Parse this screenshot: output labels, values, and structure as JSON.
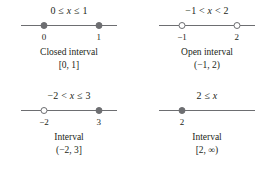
{
  "figure": {
    "kind": "number-line-interval-diagram",
    "line_color": "#6d6e71",
    "text_color": "#231f20",
    "background": "#ffffff"
  },
  "panels": [
    {
      "id": "closed-interval",
      "inequality": "0 ≤ x ≤ 1",
      "inequality_parts": {
        "left": "0 ≤ ",
        "variable": "x",
        "right": " ≤ 1"
      },
      "caption": "Closed interval",
      "notation": "[0, 1]",
      "endpoints": [
        {
          "label": "0",
          "type": "filled",
          "pos_pct": 24
        },
        {
          "label": "1",
          "type": "filled",
          "pos_pct": 81
        }
      ]
    },
    {
      "id": "open-interval",
      "inequality": "−1 < x < 2",
      "inequality_parts": {
        "left": "−1 < ",
        "variable": "x",
        "right": " < 2"
      },
      "caption": "Open interval",
      "notation": "(−1, 2)",
      "endpoints": [
        {
          "label": "−1",
          "type": "open",
          "pos_pct": 24
        },
        {
          "label": "2",
          "type": "open",
          "pos_pct": 81
        }
      ]
    },
    {
      "id": "half-open-interval",
      "inequality": "−2 < x ≤ 3",
      "inequality_parts": {
        "left": "−2 < ",
        "variable": "x",
        "right": " ≤ 3"
      },
      "caption": "Interval",
      "notation": "(−2, 3]",
      "endpoints": [
        {
          "label": "−2",
          "type": "open",
          "pos_pct": 24
        },
        {
          "label": "3",
          "type": "filled",
          "pos_pct": 81
        }
      ]
    },
    {
      "id": "unbounded-interval",
      "inequality": "2 ≤ x",
      "inequality_parts": {
        "left": "2 ≤ ",
        "variable": "x",
        "right": ""
      },
      "caption": "Interval",
      "notation": "[2, ∞)",
      "endpoints": [
        {
          "label": "2",
          "type": "filled",
          "pos_pct": 24
        }
      ]
    }
  ]
}
